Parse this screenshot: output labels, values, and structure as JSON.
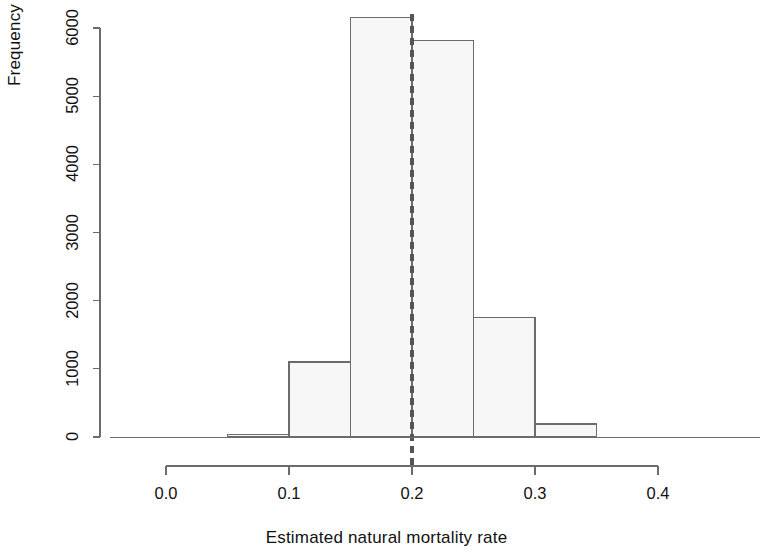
{
  "chart_data": {
    "type": "bar",
    "subtype": "histogram",
    "title": "",
    "xlabel": "Estimated natural mortality rate",
    "ylabel": "Frequency",
    "xlim": [
      0.0,
      0.4
    ],
    "ylim": [
      0,
      6200
    ],
    "grid": false,
    "legend": null,
    "bin_width": 0.05,
    "bin_edges": [
      0.0,
      0.05,
      0.1,
      0.15,
      0.2,
      0.25,
      0.3,
      0.35,
      0.4
    ],
    "categories": [
      "0.00-0.05",
      "0.05-0.10",
      "0.10-0.15",
      "0.15-0.20",
      "0.20-0.25",
      "0.25-0.30",
      "0.30-0.35",
      "0.35-0.40"
    ],
    "values": [
      0,
      35,
      1100,
      6150,
      5820,
      1750,
      190,
      0
    ],
    "bars": [
      {
        "x0": 0.0,
        "x1": 0.05,
        "value": 0
      },
      {
        "x0": 0.05,
        "x1": 0.1,
        "value": 35
      },
      {
        "x0": 0.1,
        "x1": 0.15,
        "value": 1100
      },
      {
        "x0": 0.15,
        "x1": 0.2,
        "value": 6150
      },
      {
        "x0": 0.2,
        "x1": 0.25,
        "value": 5820
      },
      {
        "x0": 0.25,
        "x1": 0.3,
        "value": 1750
      },
      {
        "x0": 0.3,
        "x1": 0.35,
        "value": 190
      },
      {
        "x0": 0.35,
        "x1": 0.4,
        "value": 0
      }
    ],
    "xticks": [
      0.0,
      0.1,
      0.2,
      0.3,
      0.4
    ],
    "xtick_labels": [
      "0.0",
      "0.1",
      "0.2",
      "0.3",
      "0.4"
    ],
    "yticks": [
      0,
      1000,
      2000,
      3000,
      4000,
      5000,
      6000
    ],
    "ytick_labels": [
      "0",
      "1000",
      "2000",
      "3000",
      "4000",
      "5000",
      "6000"
    ],
    "annotations": [
      {
        "type": "vline",
        "name": "reference-line",
        "x": 0.2,
        "style": "dashed",
        "color": "#555555",
        "label": ""
      }
    ],
    "colors": {
      "bar_fill": "#f7f7f7",
      "bar_edge": "#6b6b6b",
      "axis": "#6b6b6b",
      "text": "#111111",
      "reference_line": "#555555",
      "background": "#ffffff"
    }
  },
  "axes": {
    "y_title": "Frequency",
    "x_title": "Estimated natural mortality rate"
  }
}
